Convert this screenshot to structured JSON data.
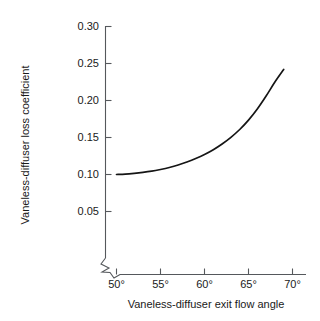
{
  "chart_data": {
    "type": "line",
    "title": "",
    "xlabel": "Vaneless-diffuser exit flow angle",
    "ylabel": "Vaneless-diffuser loss coefficient",
    "xlim": [
      48.0,
      71.5
    ],
    "ylim": [
      0.05,
      0.3
    ],
    "grid": false,
    "legend": null,
    "axis_break": {
      "axis": "y",
      "symbol": "zigzag",
      "location": "below 0.05 at origin corner"
    },
    "x_ticks": [
      50,
      55,
      60,
      65,
      70
    ],
    "x_tick_labels": [
      "50°",
      "55°",
      "60°",
      "65°",
      "70°"
    ],
    "y_ticks": [
      0.05,
      0.1,
      0.15,
      0.2,
      0.25,
      0.3
    ],
    "y_tick_labels": [
      "0.05",
      "0.10",
      "0.15",
      "0.20",
      "0.25",
      "0.30"
    ],
    "series": [
      {
        "name": "Vaneless-diffuser loss coefficient",
        "color": "#151515",
        "x": [
          50.0,
          51.0,
          52.0,
          53.0,
          54.0,
          55.0,
          56.0,
          57.0,
          58.0,
          59.0,
          60.0,
          61.0,
          62.0,
          63.0,
          64.0,
          65.0,
          66.0,
          67.0,
          68.0,
          69.0
        ],
        "values": [
          0.1,
          0.1005,
          0.1015,
          0.1028,
          0.1045,
          0.1068,
          0.1095,
          0.1128,
          0.1168,
          0.1215,
          0.127,
          0.1335,
          0.1412,
          0.1502,
          0.1608,
          0.1735,
          0.1885,
          0.206,
          0.225,
          0.242
        ]
      }
    ]
  },
  "labels": {
    "xlabel": "Vaneless-diffuser exit flow angle",
    "ylabel": "Vaneless-diffuser loss coefficient",
    "y_0": "0.05",
    "y_1": "0.10",
    "y_2": "0.15",
    "y_3": "0.20",
    "y_4": "0.25",
    "y_5": "0.30",
    "x_0": "50°",
    "x_1": "55°",
    "x_2": "60°",
    "x_3": "65°",
    "x_4": "70°"
  },
  "colors": {
    "curve": "#151515",
    "axis": "#55585c",
    "text": "#1a1a1a",
    "background": "#ffffff"
  }
}
